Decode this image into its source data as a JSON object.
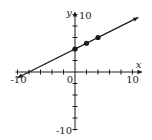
{
  "chart_data": {
    "type": "line",
    "title": "",
    "xlabel": "x",
    "ylabel": "y",
    "xlim": [
      -10,
      10
    ],
    "ylim": [
      -10,
      10
    ],
    "tick_step": 2,
    "grid": false,
    "tick_labels": {
      "x_min": "-10",
      "x_max": "10",
      "y_min": "-10",
      "y_max": "10",
      "origin": "0"
    },
    "line": {
      "equation": "y = 0.5x + 4",
      "slope": 0.5,
      "intercept": 4,
      "x_start": -10,
      "x_end": 11,
      "arrows": "both"
    },
    "points": [
      {
        "x": 0,
        "y": 4
      },
      {
        "x": 2,
        "y": 5
      },
      {
        "x": 4,
        "y": 6
      }
    ]
  },
  "colors": {
    "ink": "#1a1a1a",
    "background": "#ffffff"
  }
}
